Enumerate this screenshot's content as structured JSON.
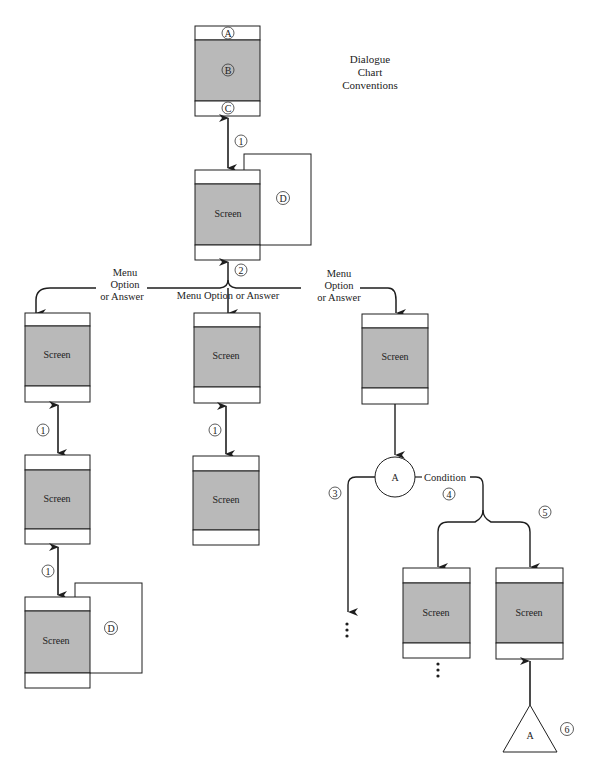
{
  "title": {
    "lines": [
      "Dialogue",
      "Chart",
      "Conventions"
    ]
  },
  "legend_screen": {
    "markers": {
      "top": "A",
      "middle": "B",
      "bottom": "C"
    }
  },
  "screen_label": "Screen",
  "overlay_marker": "D",
  "step_markers": {
    "one": "1",
    "two": "2",
    "three": "3",
    "four": "4",
    "five": "5",
    "six": "6"
  },
  "branch_labels": {
    "left": [
      "Menu",
      "Option",
      "or Answer"
    ],
    "center": "Menu Option or Answer",
    "right": [
      "Menu",
      "Option",
      "or Answer"
    ]
  },
  "connector": {
    "circle_label": "A",
    "triangle_label": "A",
    "condition_label": "Condition"
  },
  "colors": {
    "screen_body": "#b9b9b9",
    "stroke": "#1e1e1e",
    "background": "#ffffff"
  }
}
